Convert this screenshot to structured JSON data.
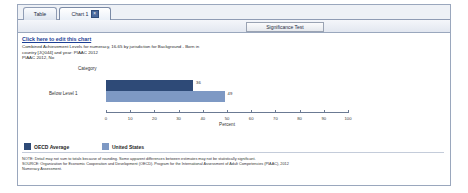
{
  "window": {
    "tabs": [
      {
        "label": "Table",
        "active": false,
        "closable": false
      },
      {
        "label": "Chart 1",
        "active": true,
        "closable": true,
        "close_glyph": "×"
      }
    ]
  },
  "toolbar": {
    "chart_button": "Chart",
    "significance_button": "Significance Test"
  },
  "main": {
    "edit_link": "Click here to edit this chart",
    "subtitle_lines": [
      "Combined Achievement Levels for numeracy, 16-65 by jurisdiction for Background - Born in",
      "country [JQ044] and year: PIAAC 2012",
      "PIAAC 2012, No"
    ]
  },
  "legend": {
    "items": [
      {
        "label": "OECD Average",
        "color": "#2e4a77"
      },
      {
        "label": "United States",
        "color": "#7e99c4"
      }
    ]
  },
  "footnote": {
    "lines": [
      "NOTE:  Detail may not sum to totals because of rounding. Some apparent differences between estimates may not be statistically significant.",
      "SOURCE: Organization for Economic Cooperation and Development (OECD). Program for the International Assessment of Adult Competencies (PIAAC), 2012",
      "Numeracy Assessment."
    ]
  },
  "chart_data": {
    "type": "bar",
    "orientation": "horizontal",
    "title": "",
    "xlabel": "Percent",
    "ylabel": "Category",
    "categories": [
      "Below Level 1"
    ],
    "xlim": [
      0,
      100
    ],
    "xticks": [
      0,
      10,
      20,
      30,
      40,
      50,
      60,
      70,
      80,
      90,
      100
    ],
    "grid": false,
    "legend_position": "bottom-left",
    "series": [
      {
        "name": "OECD Average",
        "color": "#2e4a77",
        "values": [
          36
        ]
      },
      {
        "name": "United States",
        "color": "#7e99c4",
        "values": [
          49
        ]
      }
    ]
  }
}
